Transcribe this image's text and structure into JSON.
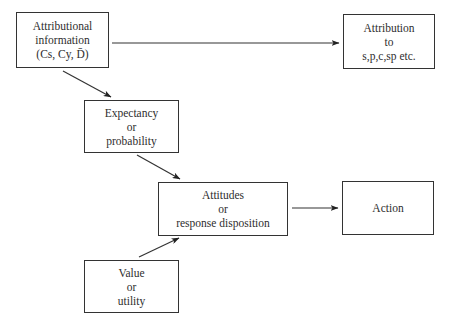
{
  "diagram": {
    "type": "flowchart",
    "colors": {
      "stroke": "#333333",
      "text": "#2e2e2e",
      "background": "#ffffff"
    },
    "nodes": [
      {
        "id": "attributional-information",
        "lines": [
          "Attributional",
          "information",
          "(Cs, Cy, D̄)"
        ]
      },
      {
        "id": "attribution",
        "lines": [
          "Attribution",
          "to",
          "s,p,c,sp etc."
        ]
      },
      {
        "id": "expectancy",
        "lines": [
          "Expectancy",
          "or",
          "probability"
        ]
      },
      {
        "id": "attitudes",
        "lines": [
          "Attitudes",
          "or",
          "response disposition"
        ]
      },
      {
        "id": "action",
        "lines": [
          "Action"
        ]
      },
      {
        "id": "value",
        "lines": [
          "Value",
          "or",
          "utility"
        ]
      }
    ],
    "edges": [
      {
        "from": "attributional-information",
        "to": "attribution"
      },
      {
        "from": "attributional-information",
        "to": "expectancy"
      },
      {
        "from": "expectancy",
        "to": "attitudes"
      },
      {
        "from": "value",
        "to": "attitudes"
      },
      {
        "from": "attitudes",
        "to": "action"
      }
    ]
  }
}
